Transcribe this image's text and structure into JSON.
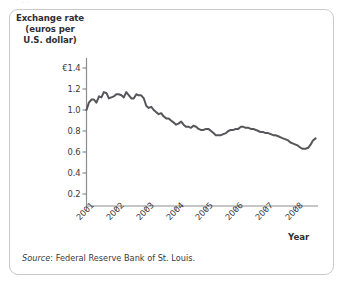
{
  "figure": {
    "top_fragment_text": "·          ·",
    "source_label": "Source",
    "source_separator": ":",
    "source_text": "Federal Reserve Bank of St. Louis.",
    "frame_color": "#c9c9c9",
    "line_color": "#55555a",
    "axis_color": "#8c8c90",
    "text_color": "#2f2f33"
  },
  "chart_data": {
    "type": "line",
    "title": "",
    "ylabel": "Exchange rate (euros per U.S. dollar)",
    "ylabel_lines": [
      "Exchange rate",
      "(euros per",
      "U.S. dollar)"
    ],
    "xlabel": "Year",
    "ylim": [
      0.0,
      1.5
    ],
    "xlim": [
      2001.0,
      2008.75
    ],
    "grid": false,
    "legend": null,
    "ytick_labels": [
      "€1.4",
      "1.2",
      "1.0",
      "0.8",
      "0.6",
      "0.4",
      "0.2"
    ],
    "ytick_values": [
      1.4,
      1.2,
      1.0,
      0.8,
      0.6,
      0.4,
      0.2
    ],
    "xtick_labels": [
      "2001",
      "2002",
      "2003",
      "2004",
      "2005",
      "2006",
      "2007",
      "2008"
    ],
    "xtick_values": [
      2001,
      2002,
      2003,
      2004,
      2005,
      2006,
      2007,
      2008
    ],
    "series": [
      {
        "name": "Euros per U.S. dollar",
        "x": [
          2001.0,
          2001.08,
          2001.17,
          2001.25,
          2001.33,
          2001.42,
          2001.5,
          2001.58,
          2001.67,
          2001.75,
          2001.83,
          2001.92,
          2002.0,
          2002.08,
          2002.17,
          2002.25,
          2002.33,
          2002.42,
          2002.5,
          2002.58,
          2002.67,
          2002.75,
          2002.83,
          2002.92,
          2003.0,
          2003.08,
          2003.17,
          2003.25,
          2003.33,
          2003.42,
          2003.5,
          2003.58,
          2003.67,
          2003.75,
          2003.83,
          2003.92,
          2004.0,
          2004.08,
          2004.17,
          2004.25,
          2004.33,
          2004.42,
          2004.5,
          2004.58,
          2004.67,
          2004.75,
          2004.83,
          2004.92,
          2005.0,
          2005.08,
          2005.17,
          2005.25,
          2005.33,
          2005.42,
          2005.5,
          2005.58,
          2005.67,
          2005.75,
          2005.83,
          2005.92,
          2006.0,
          2006.08,
          2006.17,
          2006.25,
          2006.33,
          2006.42,
          2006.5,
          2006.58,
          2006.67,
          2006.75,
          2006.83,
          2006.92,
          2007.0,
          2007.08,
          2007.17,
          2007.25,
          2007.33,
          2007.42,
          2007.5,
          2007.58,
          2007.67,
          2007.75,
          2007.83,
          2007.92,
          2008.0,
          2008.08,
          2008.17,
          2008.25,
          2008.33,
          2008.42,
          2008.5,
          2008.58,
          2008.67
        ],
        "y": [
          1.0,
          1.07,
          1.1,
          1.1,
          1.07,
          1.13,
          1.12,
          1.17,
          1.16,
          1.11,
          1.12,
          1.13,
          1.15,
          1.15,
          1.14,
          1.12,
          1.17,
          1.14,
          1.11,
          1.11,
          1.15,
          1.14,
          1.14,
          1.11,
          1.04,
          1.02,
          1.03,
          1.0,
          0.98,
          0.96,
          0.97,
          0.94,
          0.92,
          0.92,
          0.9,
          0.88,
          0.86,
          0.87,
          0.89,
          0.86,
          0.84,
          0.84,
          0.83,
          0.85,
          0.84,
          0.82,
          0.81,
          0.81,
          0.82,
          0.82,
          0.8,
          0.78,
          0.76,
          0.76,
          0.76,
          0.77,
          0.78,
          0.8,
          0.81,
          0.81,
          0.82,
          0.82,
          0.84,
          0.84,
          0.83,
          0.83,
          0.82,
          0.82,
          0.81,
          0.8,
          0.79,
          0.79,
          0.78,
          0.78,
          0.77,
          0.76,
          0.76,
          0.75,
          0.74,
          0.73,
          0.72,
          0.71,
          0.69,
          0.68,
          0.67,
          0.66,
          0.64,
          0.63,
          0.63,
          0.64,
          0.67,
          0.71,
          0.73
        ]
      }
    ]
  }
}
